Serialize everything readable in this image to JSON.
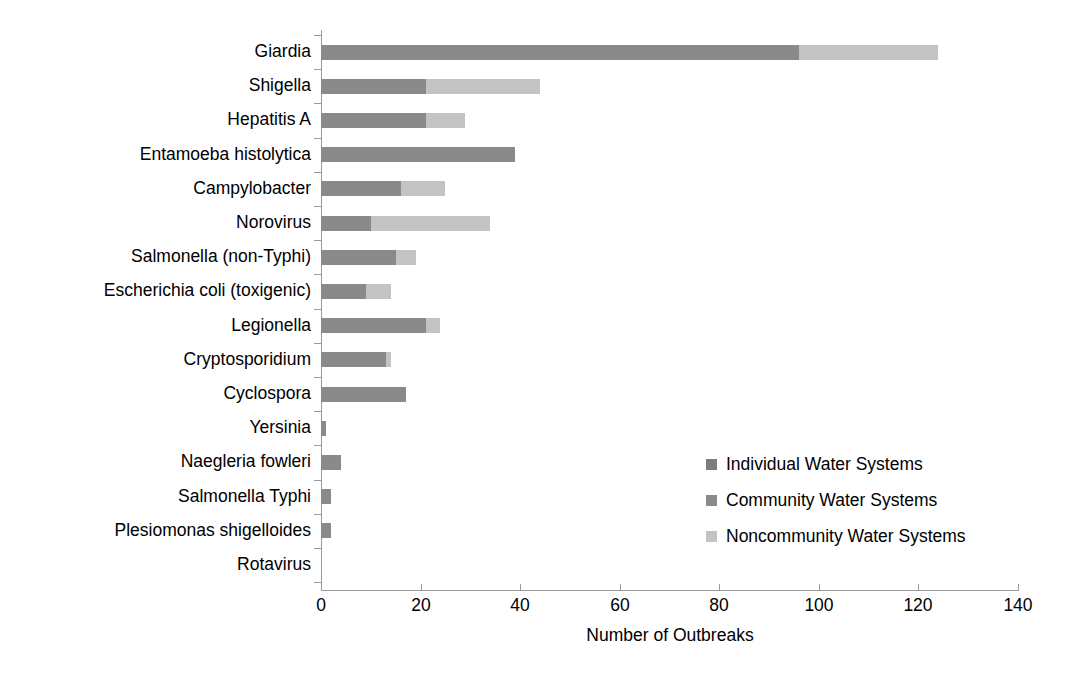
{
  "chart_data": {
    "type": "bar",
    "orientation": "horizontal",
    "stacked": true,
    "title": "",
    "xlabel": "Number of Outbreaks",
    "ylabel": "",
    "xlim": [
      0,
      140
    ],
    "xticks": [
      0,
      20,
      40,
      60,
      80,
      100,
      120,
      140
    ],
    "grid": false,
    "legend_position": "inside-right",
    "categories": [
      "Giardia",
      "Shigella",
      "Hepatitis A",
      "Entamoeba histolytica",
      "Campylobacter",
      "Norovirus",
      "Salmonella (non-Typhi)",
      "Escherichia coli (toxigenic)",
      "Legionella",
      "Cryptosporidium",
      "Cyclospora",
      "Yersinia",
      "Naegleria fowleri",
      "Salmonella Typhi",
      "Plesiomonas shigelloides",
      "Rotavirus"
    ],
    "series": [
      {
        "name": "Individual Water Systems",
        "color": "#7d7d7d",
        "values": [
          0,
          0,
          0,
          0,
          0,
          0,
          0,
          0,
          0,
          0,
          0,
          0,
          0,
          0,
          0,
          0
        ]
      },
      {
        "name": "Community Water Systems",
        "color": "#8a8a8a",
        "values": [
          96,
          21,
          21,
          39,
          16,
          10,
          15,
          9,
          21,
          13,
          17,
          1,
          4,
          2,
          2,
          0
        ]
      },
      {
        "name": "Noncommunity Water Systems",
        "color": "#c3c3c3",
        "values": [
          28,
          23,
          8,
          0,
          9,
          24,
          4,
          5,
          3,
          1,
          0,
          0,
          0,
          0,
          0,
          0
        ]
      }
    ],
    "totals": [
      124,
      44,
      29,
      39,
      25,
      34,
      19,
      14,
      24,
      14,
      17,
      1,
      4,
      2,
      2,
      0
    ]
  },
  "axis": {
    "x_title": "Number of Outbreaks",
    "x_tick_labels": [
      "0",
      "20",
      "40",
      "60",
      "80",
      "100",
      "120",
      "140"
    ]
  },
  "legend": {
    "items": [
      {
        "label": "Individual Water Systems",
        "color": "#7d7d7d"
      },
      {
        "label": "Community Water Systems",
        "color": "#8a8a8a"
      },
      {
        "label": "Noncommunity Water Systems",
        "color": "#c3c3c3"
      }
    ]
  },
  "colors": {
    "individual": "#7d7d7d",
    "community": "#8a8a8a",
    "noncommunity": "#c3c3c3",
    "axis": "#9a9a9a",
    "text": "#000000",
    "background": "#ffffff"
  }
}
